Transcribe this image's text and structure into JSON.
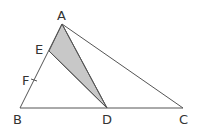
{
  "figure": {
    "type": "geometry-triangle",
    "points": {
      "A": {
        "label": "A"
      },
      "B": {
        "label": "B"
      },
      "C": {
        "label": "C"
      },
      "D": {
        "label": "D"
      },
      "E": {
        "label": "E"
      },
      "F": {
        "label": "F"
      }
    },
    "segments": [
      "AB",
      "BC",
      "CA",
      "AD",
      "ED"
    ],
    "shaded_region": "AED",
    "tick_mark_on": "AB at F",
    "colors": {
      "stroke": "#555555",
      "shade": "#c8c8c8"
    }
  }
}
